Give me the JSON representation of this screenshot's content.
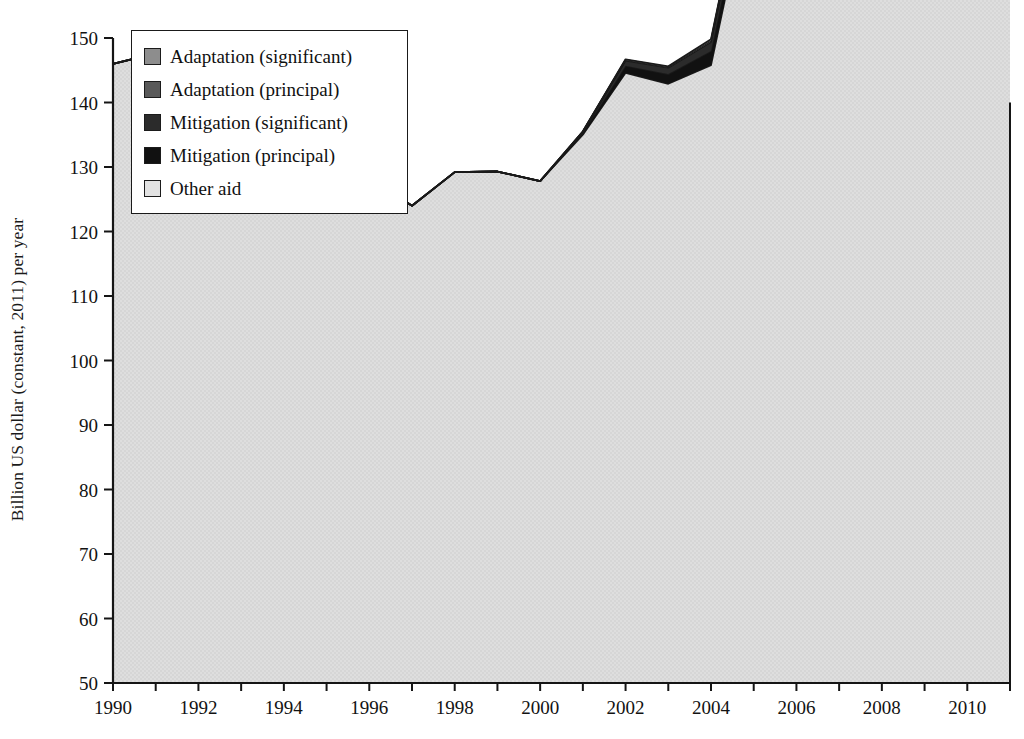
{
  "figure": {
    "kind": "stacked-area-chart",
    "background": "#ffffff"
  },
  "axes": {
    "ylabel": "Billion US dollar (constant, 2011) per year",
    "xlabel": "",
    "y_ticks": [
      "150",
      "140",
      "130",
      "120",
      "110",
      "100",
      "90",
      "80",
      "70",
      "60",
      "50"
    ],
    "x_ticks": [
      "1990",
      "1992",
      "1994",
      "1996",
      "1998",
      "2000",
      "2002",
      "2004",
      "2006",
      "2008",
      "2010"
    ]
  },
  "legend": {
    "items": [
      {
        "label": "Adaptation (significant)",
        "color": "#8d8d8d"
      },
      {
        "label": "Adaptation (principal)",
        "color": "#595959"
      },
      {
        "label": "Mitigation (significant)",
        "color": "#2b2b2b"
      },
      {
        "label": "Mitigation (principal)",
        "color": "#111111"
      },
      {
        "label": "Other aid",
        "color": "#d9d9d9"
      }
    ]
  },
  "chart_data": {
    "type": "area",
    "stacked": true,
    "title": "",
    "xlabel": "",
    "ylabel": "Billion US dollar (constant, 2011) per year",
    "xlim": [
      1990,
      2011
    ],
    "ylim": [
      50,
      150
    ],
    "ytick_step": 10,
    "xtick_step": 2,
    "minor_xticks": 1,
    "grid": false,
    "legend_position": "upper-left-inside",
    "x": [
      1990,
      1991,
      1992,
      1993,
      1994,
      1995,
      1996,
      1997,
      1998,
      1999,
      2000,
      2001,
      2002,
      2003,
      2004,
      2005,
      2006,
      2007,
      2008,
      2009,
      2010,
      2011
    ],
    "series": [
      {
        "name": "Other aid",
        "color": "#d9d9d9",
        "values": [
          96.0,
          97.6,
          90.6,
          86.3,
          88.7,
          79.2,
          78.3,
          74.0,
          79.2,
          79.3,
          77.8,
          85.0,
          94.6,
          92.9,
          95.8,
          127.0,
          123.0,
          114.5,
          123.3,
          124.6,
          110.6,
          118.9
        ]
      },
      {
        "name": "Mitigation (principal)",
        "color": "#111111",
        "values": [
          0.0,
          0.0,
          0.0,
          0.0,
          0.0,
          0.0,
          0.0,
          0.0,
          0.0,
          0.0,
          0.0,
          0.3,
          1.1,
          1.5,
          2.2,
          2.6,
          2.4,
          2.1,
          5.0,
          5.5,
          6.4,
          6.8
        ]
      },
      {
        "name": "Mitigation (significant)",
        "color": "#2b2b2b",
        "values": [
          0.0,
          0.0,
          0.0,
          0.0,
          0.0,
          0.0,
          0.0,
          0.0,
          0.0,
          0.0,
          0.0,
          0.2,
          0.8,
          1.0,
          1.4,
          1.5,
          1.4,
          1.3,
          3.0,
          3.4,
          4.3,
          4.5
        ]
      },
      {
        "name": "Adaptation (principal)",
        "color": "#595959",
        "values": [
          0.0,
          0.0,
          0.0,
          0.0,
          0.0,
          0.0,
          0.0,
          0.0,
          0.0,
          0.0,
          0.0,
          0.0,
          0.1,
          0.1,
          0.2,
          0.2,
          0.2,
          0.2,
          1.0,
          1.6,
          2.0,
          3.2
        ]
      },
      {
        "name": "Adaptation (significant)",
        "color": "#8d8d8d",
        "values": [
          0.0,
          0.0,
          0.0,
          0.0,
          0.0,
          0.0,
          0.0,
          0.0,
          0.0,
          0.0,
          0.0,
          0.0,
          0.1,
          0.1,
          0.2,
          0.2,
          0.2,
          0.2,
          1.1,
          2.3,
          6.0,
          6.6
        ]
      }
    ],
    "stack_totals": [
      96.0,
      97.6,
      90.6,
      86.3,
      88.7,
      79.2,
      78.3,
      74.0,
      79.2,
      79.3,
      77.8,
      85.5,
      96.7,
      95.6,
      99.8,
      131.5,
      127.2,
      118.3,
      133.4,
      137.4,
      129.3,
      140.0
    ]
  }
}
